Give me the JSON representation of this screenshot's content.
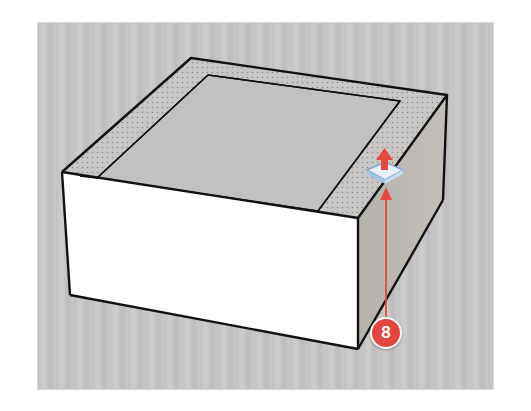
{
  "scene": {
    "description": "3D box model with inner top face offset, showing Push/Pull tool",
    "colors": {
      "background": "#c6c4c4",
      "front_face": "#ffffff",
      "side_face": "#b9b6b3",
      "top_rim": "#c4c2c0",
      "inner_face": "#c2c0bf",
      "edge": "#111111",
      "callout": "#e2463e",
      "arrow": "#e8473e",
      "tool_icon_base": "#dbe8f5"
    }
  },
  "tool": {
    "name": "push-pull-tool-cursor",
    "icon": "push-pull-icon"
  },
  "callout": {
    "number": "8"
  }
}
